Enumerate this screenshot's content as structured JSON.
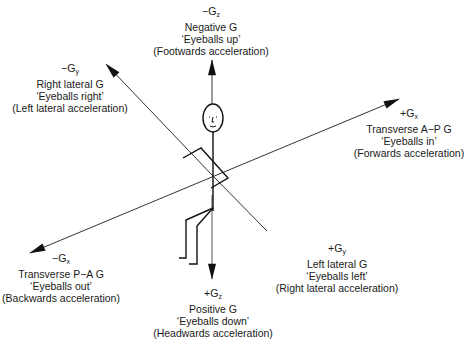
{
  "diagram": {
    "title": "",
    "axes": [
      {
        "id": "neg-gz",
        "sign": "−",
        "axis": "z",
        "lines": [
          "Negative G",
          "‘Eyeballs up’",
          "(Footwards acceleration)"
        ]
      },
      {
        "id": "neg-gy",
        "sign": "−",
        "axis": "y",
        "lines": [
          "Right lateral G",
          "‘Eyeballs right’",
          "(Left lateral acceleration)"
        ]
      },
      {
        "id": "pos-gx",
        "sign": "+",
        "axis": "x",
        "lines": [
          "Transverse A−P G",
          "‘Eyeballs in’",
          "(Forwards acceleration)"
        ]
      },
      {
        "id": "neg-gx",
        "sign": "−",
        "axis": "x",
        "lines": [
          "Transverse P−A G",
          "‘Eyeballs out’",
          "(Backwards acceleration)"
        ]
      },
      {
        "id": "pos-gy",
        "sign": "+",
        "axis": "y",
        "lines": [
          "Left lateral G",
          "‘Eyeballs left’",
          "(Right lateral acceleration)"
        ]
      },
      {
        "id": "pos-gz",
        "sign": "+",
        "axis": "z",
        "lines": [
          "Positive G",
          "‘Eyeballs down’",
          "(Headwards acceleration)"
        ]
      }
    ],
    "symbol_letter": "G",
    "line_color": "#222222"
  }
}
